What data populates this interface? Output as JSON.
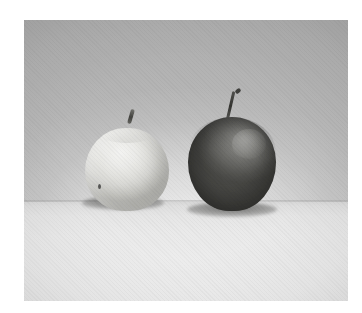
{
  "image": {
    "kind": "photograph",
    "medium": "halftone-printed grayscale photograph",
    "caption": "Two apples side by side on a table",
    "alt_text": "Black and white halftone photograph of two apples resting on a pale tabletop against a grey backdrop; the left apple is pale and the right apple is dark.",
    "orientation": "landscape",
    "color_mode": "grayscale",
    "plate": {
      "left": 24,
      "top": 20,
      "width": 324,
      "height": 281
    },
    "margin_color": "#ffffff"
  },
  "scene": {
    "backdrop": {
      "name": "studio backdrop wall",
      "description": "smooth grey seamless backdrop, darker toward the upper corners",
      "tone_top": "#a8a8a8",
      "tone_bottom": "#c0c0c0",
      "vignette": "corners darkened"
    },
    "surface": {
      "name": "tabletop",
      "description": "pale flat tabletop receding to a soft horizon line",
      "horizon_y": 182,
      "tone_near_edge": "#d4d4d4",
      "tone_foreground": "#eeeeee"
    },
    "lighting": {
      "key_light_direction": "upper left, soft and diffuse",
      "highlight_side": "upper left on the pale apple, upper right on the dark apple",
      "shadow_type": "soft contact shadow directly beneath each apple"
    }
  },
  "subjects": [
    {
      "id": "apple-light",
      "label": "Pale apple",
      "position": "left",
      "tone": "light",
      "description": "pale, evenly lit apple with a short stubby stem and a small dark blemish on its lower left side",
      "body_color_light": "#f2f2f0",
      "body_color_shadow": "#b3b3ae",
      "stem_color": "#3d3d3a",
      "width_px": 84,
      "height_px": 83,
      "has_blemish": true,
      "stem": {
        "label": "stem",
        "length": "short",
        "tilt": "leaning right"
      }
    },
    {
      "id": "apple-dark",
      "label": "Dark apple",
      "position": "right",
      "tone": "dark",
      "description": "dark, glossy apple, slightly larger and taller, with a long thin curving stem",
      "body_color_light": "#8d8d8a",
      "body_color_shadow": "#434340",
      "stem_color": "#2f2f2c",
      "width_px": 88,
      "height_px": 94,
      "has_blemish": false,
      "stem": {
        "label": "stem",
        "length": "long",
        "tilt": "curving up and to the right"
      }
    }
  ]
}
